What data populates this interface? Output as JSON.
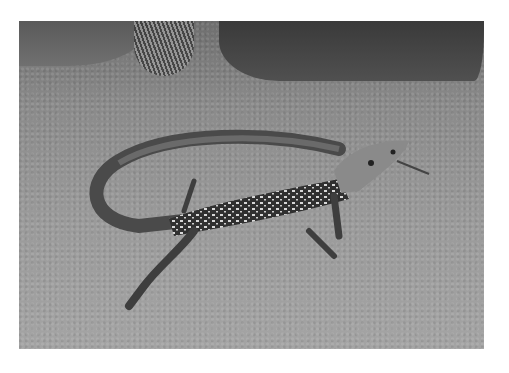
{
  "image": {
    "description": "Black-and-white photograph of a spotted whiptail lizard on sandy gravel ground, tail curving back over its body, head raised to the right",
    "subject": "lizard",
    "setting": "sandy desert ground with rock and grass tuft at top",
    "colors": {
      "background_border": "#ffffff",
      "ground": "#9a9a9a",
      "lizard_body": "#3a3a3a",
      "lizard_spots": "#d8d8d8"
    }
  }
}
